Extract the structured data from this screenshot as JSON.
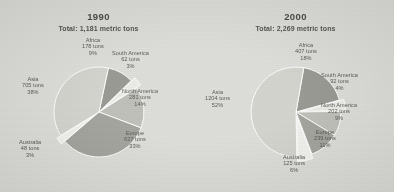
{
  "figure": {
    "background_color": "#d9d9d6",
    "panels": [
      "1990",
      "2000"
    ]
  },
  "chart_data": [
    {
      "type": "pie",
      "title": "1990",
      "subtitle": "Total: 1,181 metric tons",
      "total": 1181,
      "units": "metric tons",
      "categories": [
        "Africa",
        "South America",
        "North America",
        "Europe",
        "Australia",
        "Asia"
      ],
      "values": [
        178,
        62,
        281,
        627,
        48,
        705
      ],
      "percents": [
        9,
        3,
        14,
        33,
        3,
        38
      ],
      "labels": [
        {
          "name": "Africa",
          "tons": "178 tons",
          "percent": "9%"
        },
        {
          "name": "South America",
          "tons": "62 tons",
          "percent": "3%"
        },
        {
          "name": "North America",
          "tons": "281 tons",
          "percent": "14%"
        },
        {
          "name": "Europe",
          "tons": "627 tons",
          "percent": "33%"
        },
        {
          "name": "Australia",
          "tons": "48 tons",
          "percent": "3%"
        },
        {
          "name": "Asia",
          "tons": "705 tons",
          "percent": "38%"
        }
      ],
      "slice_colors": [
        "#8f8f89",
        "#e8e8e4",
        "#b9b9b3",
        "#9b9b95",
        "#efefeb",
        "#cfcfc9"
      ],
      "legend": "none",
      "grid": false
    },
    {
      "type": "pie",
      "title": "2000",
      "subtitle": "Total: 2,269 metric tons",
      "total": 2269,
      "units": "metric tons",
      "categories": [
        "Africa",
        "South America",
        "North America",
        "Europe",
        "Australia",
        "Asia"
      ],
      "values": [
        407,
        92,
        202,
        239,
        125,
        1204
      ],
      "percents": [
        18,
        4,
        9,
        11,
        6,
        52
      ],
      "labels": [
        {
          "name": "Africa",
          "tons": "407 tons",
          "percent": "18%"
        },
        {
          "name": "South America",
          "tons": "92 tons",
          "percent": "4%"
        },
        {
          "name": "North America",
          "tons": "202 tons",
          "percent": "9%"
        },
        {
          "name": "Europe",
          "tons": "239 tons",
          "percent": "11%"
        },
        {
          "name": "Australia",
          "tons": "125 tons",
          "percent": "6%"
        },
        {
          "name": "Asia",
          "tons": "1204 tons",
          "percent": "52%"
        }
      ],
      "slice_colors": [
        "#8f8f89",
        "#e8e8e4",
        "#b9b9b3",
        "#9b9b95",
        "#efefeb",
        "#cfcfc9"
      ],
      "legend": "none",
      "grid": false
    }
  ]
}
